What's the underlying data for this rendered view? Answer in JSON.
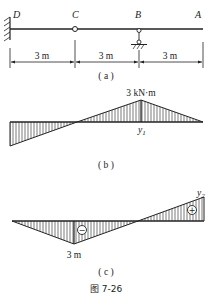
{
  "figure": {
    "caption": "图 7-26",
    "panel_a": {
      "label": "( a )",
      "nodes": {
        "D": "D",
        "C": "C",
        "B": "B",
        "A": "A"
      },
      "dimensions": [
        "3 m",
        "3 m",
        "3 m"
      ]
    },
    "panel_b": {
      "label": "( b )",
      "peak_label": "3 kN·m",
      "ordinate_label": "y",
      "ordinate_sub": "1"
    },
    "panel_c": {
      "label": "( c )",
      "ordinate_label": "y",
      "ordinate_sub": "2",
      "bottom_label": "3 m",
      "neg_sign": "−",
      "pos_sign": "+"
    }
  }
}
